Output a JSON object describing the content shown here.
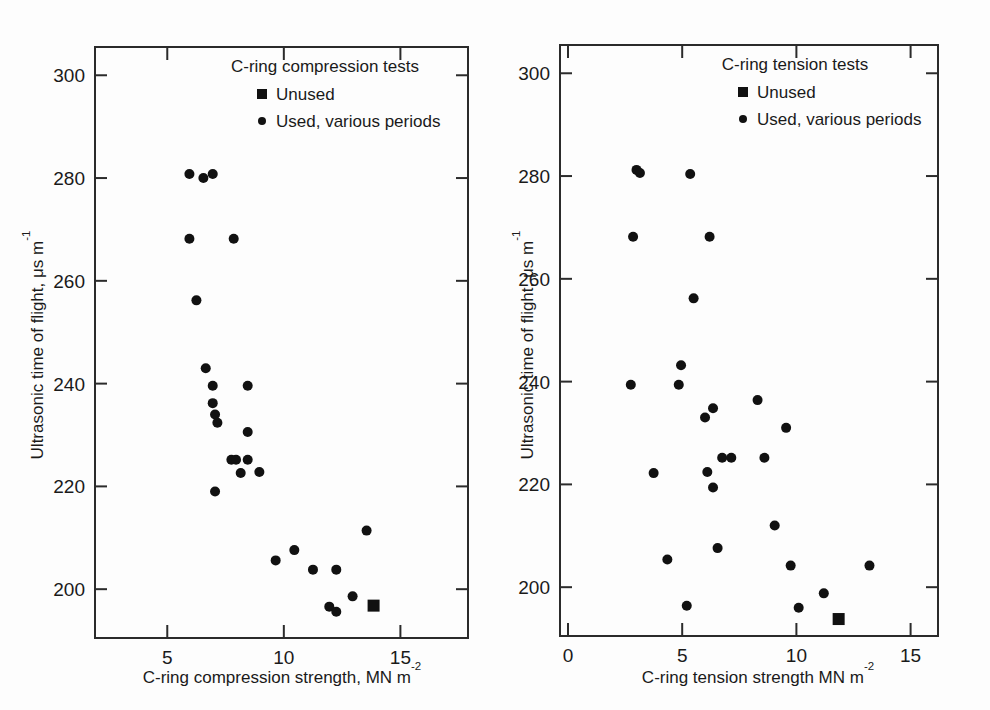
{
  "figure": {
    "background": "#fdfdfd",
    "ink_color": "#111111"
  },
  "chart_data": [
    {
      "panel_id": "left",
      "type": "scatter",
      "title": "C-ring compression tests",
      "xlabel": "C-ring compression strength, MN m",
      "xlabel_sup": "-2",
      "ylabel": "Ultrasonic time of flight, ",
      "ylabel_unit": "μs m",
      "ylabel_sup": "-1",
      "xlim": [
        1.9,
        17.9
      ],
      "ylim": [
        190.5,
        305.5
      ],
      "xticks": [
        5,
        10,
        15
      ],
      "xtick_labels": [
        "5",
        "10",
        "15"
      ],
      "yticks": [
        200,
        220,
        240,
        260,
        280,
        300
      ],
      "ytick_labels": [
        "200",
        "220",
        "240",
        "260",
        "280",
        "300"
      ],
      "grid": false,
      "legend_position": "top-right-inside",
      "legend": [
        {
          "marker": "square",
          "label": "Unused"
        },
        {
          "marker": "circle",
          "label": "Used, various periods"
        }
      ],
      "series": [
        {
          "name": "Used, various periods",
          "marker": "circle",
          "points": [
            [
              5.95,
              280.8
            ],
            [
              6.55,
              280.0
            ],
            [
              6.95,
              280.8
            ],
            [
              5.95,
              268.2
            ],
            [
              7.85,
              268.2
            ],
            [
              6.25,
              256.2
            ],
            [
              6.65,
              243.0
            ],
            [
              6.95,
              239.6
            ],
            [
              8.45,
              239.6
            ],
            [
              6.95,
              236.2
            ],
            [
              7.05,
              234.0
            ],
            [
              7.15,
              232.4
            ],
            [
              8.45,
              230.6
            ],
            [
              7.75,
              225.2
            ],
            [
              7.95,
              225.2
            ],
            [
              8.45,
              225.2
            ],
            [
              8.15,
              222.6
            ],
            [
              8.95,
              222.8
            ],
            [
              7.05,
              219.0
            ],
            [
              13.55,
              211.4
            ],
            [
              10.45,
              207.6
            ],
            [
              9.65,
              205.6
            ],
            [
              11.25,
              203.8
            ],
            [
              12.25,
              203.8
            ],
            [
              12.95,
              198.6
            ],
            [
              11.95,
              196.6
            ],
            [
              12.25,
              195.6
            ]
          ]
        },
        {
          "name": "Unused",
          "marker": "square",
          "points": [
            [
              13.85,
              196.8
            ]
          ]
        }
      ]
    },
    {
      "panel_id": "right",
      "type": "scatter",
      "title": "C-ring tension tests",
      "xlabel": "C-ring tension strength MN m",
      "xlabel_sup": "-2",
      "ylabel": "Ultrasonic time of flight, ",
      "ylabel_unit": "μs m",
      "ylabel_sup": "-1",
      "xlim": [
        -0.35,
        16.2
      ],
      "ylim": [
        190.5,
        305.5
      ],
      "xticks": [
        0,
        5,
        10,
        15
      ],
      "xtick_labels": [
        "0",
        "5",
        "10",
        "15"
      ],
      "yticks": [
        200,
        220,
        240,
        260,
        280,
        300
      ],
      "ytick_labels": [
        "200",
        "220",
        "240",
        "260",
        "280",
        "300"
      ],
      "grid": false,
      "legend_position": "top-right-inside",
      "legend": [
        {
          "marker": "square",
          "label": "Unused"
        },
        {
          "marker": "circle",
          "label": "Used, various periods"
        }
      ],
      "series": [
        {
          "name": "Used, various periods",
          "marker": "circle",
          "points": [
            [
              3.0,
              281.2
            ],
            [
              3.15,
              280.6
            ],
            [
              5.35,
              280.4
            ],
            [
              2.85,
              268.2
            ],
            [
              6.2,
              268.2
            ],
            [
              5.5,
              256.2
            ],
            [
              4.95,
              243.2
            ],
            [
              2.75,
              239.4
            ],
            [
              4.85,
              239.4
            ],
            [
              6.35,
              234.8
            ],
            [
              6.0,
              233.0
            ],
            [
              8.3,
              236.4
            ],
            [
              9.55,
              231.0
            ],
            [
              6.75,
              225.2
            ],
            [
              7.15,
              225.2
            ],
            [
              8.6,
              225.2
            ],
            [
              3.75,
              222.2
            ],
            [
              6.1,
              222.4
            ],
            [
              6.35,
              219.4
            ],
            [
              9.05,
              212.0
            ],
            [
              6.55,
              207.6
            ],
            [
              4.35,
              205.4
            ],
            [
              9.75,
              204.2
            ],
            [
              13.2,
              204.2
            ],
            [
              11.2,
              198.8
            ],
            [
              5.2,
              196.4
            ],
            [
              10.1,
              196.0
            ]
          ]
        },
        {
          "name": "Unused",
          "marker": "square",
          "points": [
            [
              11.85,
              193.8
            ]
          ]
        }
      ]
    }
  ]
}
